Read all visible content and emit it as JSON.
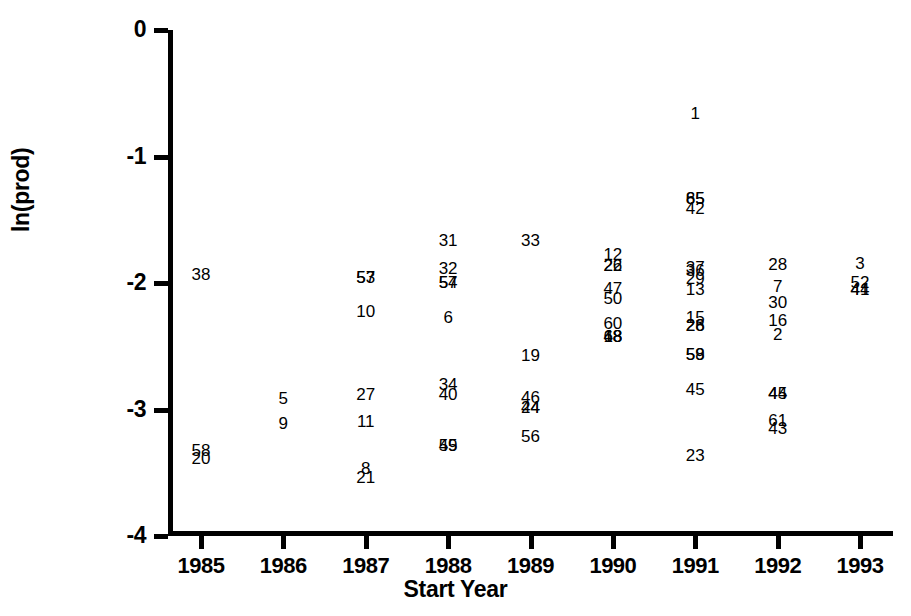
{
  "chart_data": {
    "type": "scatter",
    "title": "",
    "xlabel": "Start Year",
    "ylabel": "ln(prod)",
    "xlim": [
      1984.6,
      1993.4
    ],
    "ylim": [
      -4,
      0
    ],
    "grid": false,
    "legend": "none",
    "point_style": "case-number-text-labels",
    "xticks": [
      "1985",
      "1986",
      "1987",
      "1988",
      "1989",
      "1990",
      "1991",
      "1992",
      "1993"
    ],
    "xtick_values": [
      1985,
      1986,
      1987,
      1988,
      1989,
      1990,
      1991,
      1992,
      1993
    ],
    "yticks": [
      "0",
      "-1",
      "-2",
      "-3",
      "-4"
    ],
    "ytick_values": [
      0,
      -1,
      -2,
      -3,
      -4
    ],
    "points": [
      {
        "label": "38",
        "x": 1985.0,
        "y": -1.93
      },
      {
        "label": "58",
        "x": 1985.0,
        "y": -3.32
      },
      {
        "label": "20",
        "x": 1985.0,
        "y": -3.38
      },
      {
        "label": "5",
        "x": 1986.0,
        "y": -2.91
      },
      {
        "label": "9",
        "x": 1986.0,
        "y": -3.11
      },
      {
        "label": "57",
        "x": 1987.0,
        "y": -1.95
      },
      {
        "label": "53",
        "x": 1987.0,
        "y": -1.95
      },
      {
        "label": "10",
        "x": 1987.0,
        "y": -2.22
      },
      {
        "label": "27",
        "x": 1987.0,
        "y": -2.88
      },
      {
        "label": "11",
        "x": 1987.0,
        "y": -3.09
      },
      {
        "label": "8",
        "x": 1987.0,
        "y": -3.46
      },
      {
        "label": "21",
        "x": 1987.0,
        "y": -3.53
      },
      {
        "label": "31",
        "x": 1988.0,
        "y": -1.66
      },
      {
        "label": "32",
        "x": 1988.0,
        "y": -1.88
      },
      {
        "label": "54",
        "x": 1988.0,
        "y": -1.99
      },
      {
        "label": "57",
        "x": 1988.0,
        "y": -1.99
      },
      {
        "label": "6",
        "x": 1988.0,
        "y": -2.27
      },
      {
        "label": "34",
        "x": 1988.0,
        "y": -2.8
      },
      {
        "label": "40",
        "x": 1988.0,
        "y": -2.88
      },
      {
        "label": "49",
        "x": 1988.0,
        "y": -3.28
      },
      {
        "label": "55",
        "x": 1988.0,
        "y": -3.28
      },
      {
        "label": "33",
        "x": 1989.0,
        "y": -1.66
      },
      {
        "label": "19",
        "x": 1989.0,
        "y": -2.57
      },
      {
        "label": "46",
        "x": 1989.0,
        "y": -2.9
      },
      {
        "label": "24",
        "x": 1989.0,
        "y": -2.98
      },
      {
        "label": "44",
        "x": 1989.0,
        "y": -2.98
      },
      {
        "label": "56",
        "x": 1989.0,
        "y": -3.21
      },
      {
        "label": "12",
        "x": 1990.0,
        "y": -1.77
      },
      {
        "label": "22",
        "x": 1990.0,
        "y": -1.86
      },
      {
        "label": "26",
        "x": 1990.0,
        "y": -1.86
      },
      {
        "label": "47",
        "x": 1990.0,
        "y": -2.04
      },
      {
        "label": "50",
        "x": 1990.0,
        "y": -2.12
      },
      {
        "label": "60",
        "x": 1990.0,
        "y": -2.32
      },
      {
        "label": "48",
        "x": 1990.0,
        "y": -2.42
      },
      {
        "label": "68",
        "x": 1990.0,
        "y": -2.42
      },
      {
        "label": "18",
        "x": 1990.0,
        "y": -2.42
      },
      {
        "label": "1",
        "x": 1991.0,
        "y": -0.66
      },
      {
        "label": "85",
        "x": 1991.0,
        "y": -1.33
      },
      {
        "label": "65",
        "x": 1991.0,
        "y": -1.33
      },
      {
        "label": "42",
        "x": 1991.0,
        "y": -1.41
      },
      {
        "label": "37",
        "x": 1991.0,
        "y": -1.87
      },
      {
        "label": "36",
        "x": 1991.0,
        "y": -1.9
      },
      {
        "label": "29",
        "x": 1991.0,
        "y": -1.96
      },
      {
        "label": "13",
        "x": 1991.0,
        "y": -2.05
      },
      {
        "label": "15",
        "x": 1991.0,
        "y": -2.27
      },
      {
        "label": "28",
        "x": 1991.0,
        "y": -2.33
      },
      {
        "label": "26",
        "x": 1991.0,
        "y": -2.33
      },
      {
        "label": "58",
        "x": 1991.0,
        "y": -2.56
      },
      {
        "label": "59",
        "x": 1991.0,
        "y": -2.56
      },
      {
        "label": "45",
        "x": 1991.0,
        "y": -2.84
      },
      {
        "label": "23",
        "x": 1991.0,
        "y": -3.36
      },
      {
        "label": "28",
        "x": 1992.0,
        "y": -1.85
      },
      {
        "label": "7",
        "x": 1992.0,
        "y": -2.02
      },
      {
        "label": "30",
        "x": 1992.0,
        "y": -2.15
      },
      {
        "label": "16",
        "x": 1992.0,
        "y": -2.29
      },
      {
        "label": "2",
        "x": 1992.0,
        "y": -2.4
      },
      {
        "label": "44",
        "x": 1992.0,
        "y": -2.87
      },
      {
        "label": "45",
        "x": 1992.0,
        "y": -2.87
      },
      {
        "label": "61",
        "x": 1992.0,
        "y": -3.08
      },
      {
        "label": "43",
        "x": 1992.0,
        "y": -3.15
      },
      {
        "label": "3",
        "x": 1993.0,
        "y": -1.84
      },
      {
        "label": "52",
        "x": 1993.0,
        "y": -1.99
      },
      {
        "label": "41",
        "x": 1993.0,
        "y": -2.05
      },
      {
        "label": "44",
        "x": 1993.0,
        "y": -2.05
      }
    ]
  }
}
